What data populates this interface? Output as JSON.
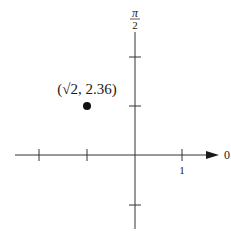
{
  "diagram": {
    "type": "polar-coordinate-plot",
    "axis_labels": {
      "polar_axis": "0",
      "vertical_axis_num": "π",
      "vertical_axis_den": "2"
    },
    "tick_labels": {
      "unit": "1"
    },
    "point": {
      "label": "(√2, 2.36)",
      "r": "√2",
      "theta": "2.36"
    },
    "colors": {
      "ink": "#1a1a1a",
      "background": "#ffffff"
    }
  }
}
